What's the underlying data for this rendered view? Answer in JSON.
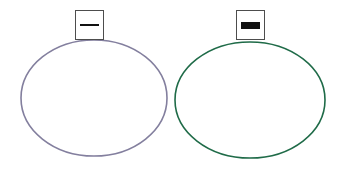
{
  "canvas": {
    "width": 343,
    "height": 169,
    "background_color": "#ffffff"
  },
  "chart_data": {
    "type": "diagram",
    "title": "",
    "shapes": [
      {
        "id": "left",
        "kind": "ellipse",
        "stroke_color": "#837f9e",
        "fill": "none",
        "stroke_width": 1.6,
        "center_x": 94,
        "center_y": 98,
        "radius_x": 73,
        "radius_y": 58
      },
      {
        "id": "right",
        "kind": "ellipse",
        "stroke_color": "#1f6b48",
        "fill": "none",
        "stroke_width": 1.6,
        "center_x": 250,
        "center_y": 100,
        "radius_x": 75,
        "radius_y": 58
      }
    ],
    "icons": [
      {
        "id": "left",
        "box_stroke_color": "#4d4d4d",
        "box_fill": "#ffffff",
        "bar_color": "#111111",
        "bar_style": "thin",
        "x": 75,
        "y": 10,
        "width": 29,
        "height": 30
      },
      {
        "id": "right",
        "box_stroke_color": "#4d4d4d",
        "box_fill": "#ffffff",
        "bar_color": "#111111",
        "bar_style": "thick",
        "x": 236,
        "y": 10,
        "width": 29,
        "height": 30
      }
    ]
  },
  "shapes": {
    "left_ellipse": {
      "label": "",
      "color": "#837f9e"
    },
    "right_ellipse": {
      "label": "",
      "color": "#1f6b48"
    }
  },
  "icons": {
    "left": {
      "label": "",
      "glyph_name": "minus-bar-icon"
    },
    "right": {
      "label": "",
      "glyph_name": "filled-bar-icon"
    }
  }
}
